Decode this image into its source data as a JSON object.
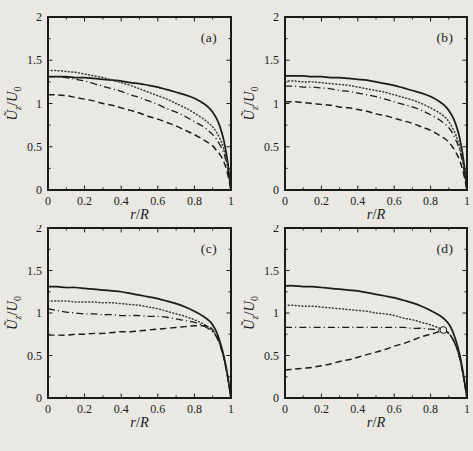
{
  "figure": {
    "background_color": "#e9e8e3",
    "ink_color": "#1b1b1b",
    "dotted_color": "#3a3a3a",
    "panel_labels": [
      "(a)",
      "(b)",
      "(c)",
      "(d)"
    ]
  },
  "chart_data": [
    {
      "type": "line",
      "panel_label": "(a)",
      "xlabel": "r/R",
      "ylabel": "Ũz/U0",
      "xlabel_rich": [
        [
          "r",
          "i"
        ],
        [
          "/",
          ""
        ],
        [
          "R",
          "i"
        ]
      ],
      "ylabel_rich": [
        [
          "Ũ",
          "i"
        ],
        [
          "z",
          "is"
        ],
        [
          "/",
          ""
        ],
        [
          "U",
          "i"
        ],
        [
          "0",
          "s"
        ]
      ],
      "xlim": [
        0,
        1
      ],
      "ylim": [
        0,
        2
      ],
      "xticks": [
        0,
        0.2,
        0.4,
        0.6,
        0.8,
        1
      ],
      "xtick_labels": [
        "0",
        "0.2",
        "0.4",
        "0.6",
        "0.8",
        "1"
      ],
      "yticks": [
        0,
        0.5,
        1,
        1.5,
        2
      ],
      "ytick_labels": [
        "0",
        "0.5",
        "1",
        "1.5",
        "2"
      ],
      "x_minor_step": 0.1,
      "y_minor_step": 0.25,
      "grid": false,
      "legend": "none",
      "x": [
        0,
        0.05,
        0.1,
        0.15,
        0.2,
        0.25,
        0.3,
        0.35,
        0.4,
        0.45,
        0.5,
        0.55,
        0.6,
        0.65,
        0.7,
        0.75,
        0.8,
        0.85,
        0.88,
        0.9,
        0.92,
        0.94,
        0.96,
        0.98,
        1
      ],
      "series": [
        {
          "name": "solid",
          "style": "solid",
          "y": [
            1.31,
            1.31,
            1.31,
            1.3,
            1.3,
            1.29,
            1.28,
            1.27,
            1.26,
            1.24,
            1.23,
            1.21,
            1.19,
            1.16,
            1.13,
            1.1,
            1.06,
            1.0,
            0.95,
            0.9,
            0.83,
            0.73,
            0.58,
            0.35,
            0
          ]
        },
        {
          "name": "dotted",
          "style": "dotted",
          "y": [
            1.38,
            1.38,
            1.37,
            1.36,
            1.34,
            1.32,
            1.3,
            1.27,
            1.24,
            1.21,
            1.17,
            1.13,
            1.09,
            1.05,
            1.0,
            0.95,
            0.89,
            0.82,
            0.77,
            0.73,
            0.67,
            0.59,
            0.48,
            0.3,
            0
          ]
        },
        {
          "name": "dash-dot",
          "style": "dashdot",
          "y": [
            1.31,
            1.31,
            1.3,
            1.28,
            1.26,
            1.23,
            1.2,
            1.17,
            1.14,
            1.1,
            1.07,
            1.03,
            0.99,
            0.94,
            0.9,
            0.85,
            0.79,
            0.73,
            0.68,
            0.64,
            0.59,
            0.52,
            0.43,
            0.27,
            0
          ]
        },
        {
          "name": "dashed",
          "style": "dashed",
          "y": [
            1.1,
            1.1,
            1.09,
            1.07,
            1.05,
            1.03,
            1.0,
            0.98,
            0.95,
            0.92,
            0.89,
            0.85,
            0.82,
            0.78,
            0.74,
            0.69,
            0.64,
            0.58,
            0.54,
            0.51,
            0.46,
            0.41,
            0.33,
            0.2,
            0
          ]
        }
      ],
      "annotations": []
    },
    {
      "type": "line",
      "panel_label": "(b)",
      "xlabel": "r/R",
      "ylabel": "Ũz/U0",
      "xlabel_rich": [
        [
          "r",
          "i"
        ],
        [
          "/",
          ""
        ],
        [
          "R",
          "i"
        ]
      ],
      "ylabel_rich": [
        [
          "Ũ",
          "i"
        ],
        [
          "z",
          "is"
        ],
        [
          "/",
          ""
        ],
        [
          "U",
          "i"
        ],
        [
          "0",
          "s"
        ]
      ],
      "xlim": [
        0,
        1
      ],
      "ylim": [
        0,
        2
      ],
      "xticks": [
        0,
        0.2,
        0.4,
        0.6,
        0.8,
        1
      ],
      "xtick_labels": [
        "0",
        "0.2",
        "0.4",
        "0.6",
        "0.8",
        "1"
      ],
      "yticks": [
        0,
        0.5,
        1,
        1.5,
        2
      ],
      "ytick_labels": [
        "0",
        "0.5",
        "1",
        "1.5",
        "2"
      ],
      "x_minor_step": 0.1,
      "y_minor_step": 0.25,
      "grid": false,
      "legend": "none",
      "x": [
        0,
        0.05,
        0.1,
        0.15,
        0.2,
        0.25,
        0.3,
        0.35,
        0.4,
        0.45,
        0.5,
        0.55,
        0.6,
        0.65,
        0.7,
        0.75,
        0.8,
        0.85,
        0.88,
        0.9,
        0.92,
        0.94,
        0.96,
        0.98,
        1
      ],
      "series": [
        {
          "name": "solid",
          "style": "solid",
          "y": [
            1.32,
            1.32,
            1.32,
            1.31,
            1.31,
            1.3,
            1.3,
            1.29,
            1.28,
            1.27,
            1.25,
            1.23,
            1.21,
            1.18,
            1.15,
            1.12,
            1.08,
            1.02,
            0.97,
            0.92,
            0.85,
            0.75,
            0.6,
            0.36,
            0
          ]
        },
        {
          "name": "dotted",
          "style": "dotted",
          "y": [
            1.26,
            1.26,
            1.25,
            1.25,
            1.24,
            1.23,
            1.22,
            1.21,
            1.19,
            1.17,
            1.15,
            1.13,
            1.1,
            1.07,
            1.04,
            1.0,
            0.95,
            0.89,
            0.84,
            0.79,
            0.72,
            0.63,
            0.5,
            0.3,
            0
          ]
        },
        {
          "name": "dash-dot",
          "style": "dashdot",
          "y": [
            1.2,
            1.2,
            1.19,
            1.19,
            1.18,
            1.17,
            1.15,
            1.14,
            1.12,
            1.1,
            1.08,
            1.05,
            1.02,
            0.99,
            0.96,
            0.92,
            0.87,
            0.81,
            0.76,
            0.72,
            0.66,
            0.57,
            0.46,
            0.27,
            0
          ]
        },
        {
          "name": "dashed",
          "style": "dashed",
          "y": [
            1.02,
            1.02,
            1.01,
            1.0,
            0.99,
            0.98,
            0.96,
            0.95,
            0.93,
            0.91,
            0.88,
            0.86,
            0.83,
            0.8,
            0.77,
            0.73,
            0.69,
            0.63,
            0.59,
            0.55,
            0.5,
            0.43,
            0.34,
            0.2,
            0
          ]
        }
      ],
      "annotations": []
    },
    {
      "type": "line",
      "panel_label": "(c)",
      "xlabel": "r/R",
      "ylabel": "Ũz/U0",
      "xlabel_rich": [
        [
          "r",
          "i"
        ],
        [
          "/",
          ""
        ],
        [
          "R",
          "i"
        ]
      ],
      "ylabel_rich": [
        [
          "Ũ",
          "i"
        ],
        [
          "z",
          "is"
        ],
        [
          "/",
          ""
        ],
        [
          "U",
          "i"
        ],
        [
          "0",
          "s"
        ]
      ],
      "xlim": [
        0,
        1
      ],
      "ylim": [
        0,
        2
      ],
      "xticks": [
        0,
        0.2,
        0.4,
        0.6,
        0.8,
        1
      ],
      "xtick_labels": [
        "0",
        "0.2",
        "0.4",
        "0.6",
        "0.8",
        "1"
      ],
      "yticks": [
        0,
        0.5,
        1,
        1.5,
        2
      ],
      "ytick_labels": [
        "0",
        "0.5",
        "1",
        "1.5",
        "2"
      ],
      "x_minor_step": 0.1,
      "y_minor_step": 0.25,
      "grid": false,
      "legend": "none",
      "x": [
        0,
        0.05,
        0.1,
        0.15,
        0.2,
        0.25,
        0.3,
        0.35,
        0.4,
        0.45,
        0.5,
        0.55,
        0.6,
        0.65,
        0.7,
        0.75,
        0.8,
        0.85,
        0.88,
        0.9,
        0.92,
        0.94,
        0.96,
        0.98,
        1
      ],
      "series": [
        {
          "name": "solid",
          "style": "solid",
          "y": [
            1.31,
            1.31,
            1.3,
            1.3,
            1.29,
            1.28,
            1.27,
            1.26,
            1.25,
            1.23,
            1.21,
            1.19,
            1.17,
            1.14,
            1.11,
            1.07,
            1.02,
            0.96,
            0.91,
            0.86,
            0.78,
            0.66,
            0.5,
            0.28,
            0
          ]
        },
        {
          "name": "dotted",
          "style": "dotted",
          "y": [
            1.14,
            1.14,
            1.14,
            1.13,
            1.13,
            1.13,
            1.12,
            1.12,
            1.11,
            1.1,
            1.09,
            1.07,
            1.05,
            1.02,
            0.99,
            0.96,
            0.92,
            0.87,
            0.83,
            0.79,
            0.73,
            0.63,
            0.48,
            0.27,
            0
          ]
        },
        {
          "name": "dash-dot",
          "style": "dashdot",
          "y": [
            1.05,
            1.03,
            1.01,
            1.0,
            0.99,
            0.99,
            0.98,
            0.98,
            0.97,
            0.97,
            0.97,
            0.96,
            0.96,
            0.95,
            0.93,
            0.91,
            0.89,
            0.85,
            0.81,
            0.78,
            0.72,
            0.62,
            0.48,
            0.27,
            0
          ]
        },
        {
          "name": "dashed",
          "style": "dashed",
          "y": [
            0.74,
            0.74,
            0.74,
            0.75,
            0.75,
            0.76,
            0.76,
            0.77,
            0.78,
            0.78,
            0.79,
            0.8,
            0.81,
            0.82,
            0.83,
            0.84,
            0.85,
            0.85,
            0.84,
            0.8,
            0.73,
            0.63,
            0.48,
            0.27,
            0
          ]
        }
      ],
      "annotations": []
    },
    {
      "type": "line",
      "panel_label": "(d)",
      "xlabel": "r/R",
      "ylabel": "Ũz/U0",
      "xlabel_rich": [
        [
          "r",
          "i"
        ],
        [
          "/",
          ""
        ],
        [
          "R",
          "i"
        ]
      ],
      "ylabel_rich": [
        [
          "Ũ",
          "i"
        ],
        [
          "z",
          "is"
        ],
        [
          "/",
          ""
        ],
        [
          "U",
          "i"
        ],
        [
          "0",
          "s"
        ]
      ],
      "xlim": [
        0,
        1
      ],
      "ylim": [
        0,
        2
      ],
      "xticks": [
        0,
        0.2,
        0.4,
        0.6,
        0.8,
        1
      ],
      "xtick_labels": [
        "0",
        "0.2",
        "0.4",
        "0.6",
        "0.8",
        "1"
      ],
      "yticks": [
        0,
        0.5,
        1,
        1.5,
        2
      ],
      "ytick_labels": [
        "0",
        "0.5",
        "1",
        "1.5",
        "2"
      ],
      "x_minor_step": 0.1,
      "y_minor_step": 0.25,
      "grid": false,
      "legend": "none",
      "x": [
        0,
        0.05,
        0.1,
        0.15,
        0.2,
        0.25,
        0.3,
        0.35,
        0.4,
        0.45,
        0.5,
        0.55,
        0.6,
        0.65,
        0.7,
        0.75,
        0.8,
        0.85,
        0.88,
        0.9,
        0.92,
        0.94,
        0.96,
        0.98,
        1
      ],
      "series": [
        {
          "name": "solid",
          "style": "solid",
          "y": [
            1.32,
            1.32,
            1.31,
            1.31,
            1.3,
            1.29,
            1.28,
            1.27,
            1.26,
            1.24,
            1.22,
            1.2,
            1.18,
            1.15,
            1.12,
            1.08,
            1.03,
            0.97,
            0.92,
            0.87,
            0.79,
            0.67,
            0.51,
            0.28,
            0
          ]
        },
        {
          "name": "dotted",
          "style": "dotted",
          "y": [
            1.09,
            1.09,
            1.08,
            1.08,
            1.07,
            1.06,
            1.05,
            1.04,
            1.03,
            1.02,
            1.0,
            0.99,
            0.97,
            0.94,
            0.92,
            0.89,
            0.86,
            0.82,
            0.79,
            0.76,
            0.7,
            0.61,
            0.47,
            0.26,
            0
          ]
        },
        {
          "name": "dash-dot",
          "style": "dashdot",
          "y": [
            0.83,
            0.83,
            0.83,
            0.83,
            0.83,
            0.83,
            0.83,
            0.83,
            0.83,
            0.83,
            0.83,
            0.83,
            0.83,
            0.83,
            0.82,
            0.82,
            0.81,
            0.8,
            0.79,
            0.76,
            0.7,
            0.61,
            0.47,
            0.26,
            0
          ]
        },
        {
          "name": "dashed",
          "style": "dashed",
          "y": [
            0.33,
            0.34,
            0.35,
            0.36,
            0.38,
            0.4,
            0.43,
            0.45,
            0.48,
            0.51,
            0.54,
            0.57,
            0.61,
            0.64,
            0.68,
            0.72,
            0.75,
            0.78,
            0.79,
            0.76,
            0.7,
            0.61,
            0.47,
            0.26,
            0
          ]
        }
      ],
      "annotations": [
        {
          "type": "open-circle",
          "x": 0.87,
          "y": 0.8
        }
      ]
    }
  ]
}
